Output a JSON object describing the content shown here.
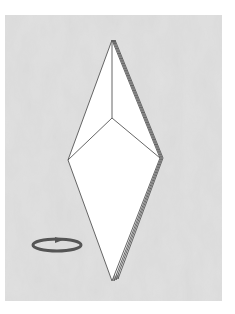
{
  "diagram": {
    "type": "origami-step",
    "background_color": "#dadada",
    "paper_color": "#ffffff",
    "line_color": "#555555",
    "shape": "elongated diamond (kite) with layered right edge",
    "symbols": [
      {
        "name": "turn-over-arrow",
        "description": "horizontal elliptical rotation arrow indicating turn the model over",
        "position": "lower-left"
      }
    ],
    "points": {
      "top": [
        112,
        40
      ],
      "center_fold": [
        112,
        118
      ],
      "left": [
        68,
        160
      ],
      "right": [
        162,
        158
      ],
      "bottom": [
        112,
        281
      ]
    }
  }
}
